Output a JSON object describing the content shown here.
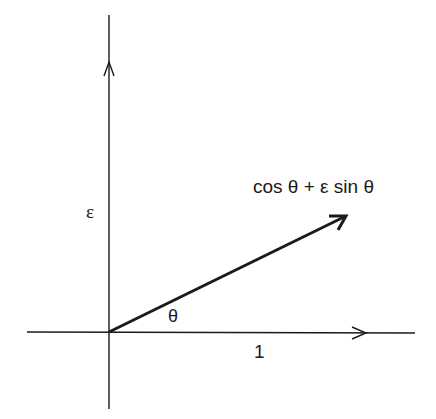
{
  "diagram": {
    "type": "vector-diagram",
    "labels": {
      "vector": "cos θ + ε sin θ",
      "vertical_axis": "ε",
      "angle": "θ",
      "horizontal_unit": "1"
    },
    "colors": {
      "stroke": "#1a1a1a",
      "background": "#ffffff"
    },
    "geometry": {
      "origin": [
        109,
        332
      ],
      "horizontal_axis": {
        "from": [
          27,
          332
        ],
        "to": [
          415,
          333
        ],
        "arrowhead_at": [
          366,
          333
        ]
      },
      "vertical_axis": {
        "from": [
          109,
          15
        ],
        "to": [
          109,
          409
        ],
        "arrowhead_at": [
          109,
          62
        ]
      },
      "vector": {
        "from": [
          109,
          332
        ],
        "to": [
          346,
          216
        ]
      }
    }
  }
}
